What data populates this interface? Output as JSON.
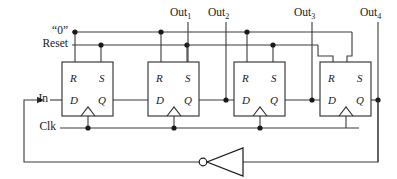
{
  "diagram": {
    "colors": {
      "wire": "#3a3a3a",
      "box_stroke": "#2b2b2b",
      "node": "#1a1a1a",
      "background": "#ffffff"
    }
  },
  "buses": [
    {
      "id": "zero",
      "label": "“0”",
      "y": 32
    },
    {
      "id": "reset",
      "label": "Reset",
      "y": 45
    },
    {
      "id": "in",
      "label": "In",
      "y": 100
    },
    {
      "id": "clk",
      "label": "Clk",
      "y": 128
    }
  ],
  "outputs": [
    {
      "id": "out1",
      "label": "Out",
      "sub": "1",
      "x": 188
    },
    {
      "id": "out2",
      "label": "Out",
      "sub": "2",
      "x": 226
    },
    {
      "id": "out3",
      "label": "Out",
      "sub": "3",
      "x": 312
    },
    {
      "id": "out4",
      "label": "Out",
      "sub": "4",
      "x": 378
    }
  ],
  "flipflops": [
    {
      "id": "ff1",
      "x": 62,
      "pins": {
        "r": "R",
        "s": "S",
        "d": "D",
        "q": "Q"
      }
    },
    {
      "id": "ff2",
      "x": 148,
      "pins": {
        "r": "R",
        "s": "S",
        "d": "D",
        "q": "Q"
      }
    },
    {
      "id": "ff3",
      "x": 234,
      "pins": {
        "r": "R",
        "s": "S",
        "d": "D",
        "q": "Q"
      }
    },
    {
      "id": "ff4",
      "x": 320,
      "pins": {
        "r": "R",
        "s": "S",
        "d": "D",
        "q": "Q"
      }
    }
  ],
  "gates": [
    {
      "id": "inverter",
      "type": "NOT",
      "x": 205,
      "y": 162
    }
  ]
}
